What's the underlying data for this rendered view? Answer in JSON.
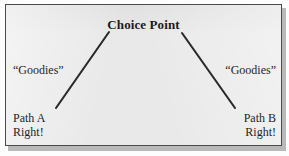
{
  "figure": {
    "title": "Choice Point",
    "left_branch": {
      "reward_label": "“Goodies”",
      "path_name": "Path A",
      "verdict": "Right!"
    },
    "right_branch": {
      "reward_label": "“Goodies”",
      "path_name": "Path B",
      "verdict": "Right!"
    },
    "colors": {
      "panel_background": "#e9e9e9",
      "border": "#4a4a4a",
      "line": "#2a2a2a",
      "text": "#1f1f1f"
    }
  }
}
